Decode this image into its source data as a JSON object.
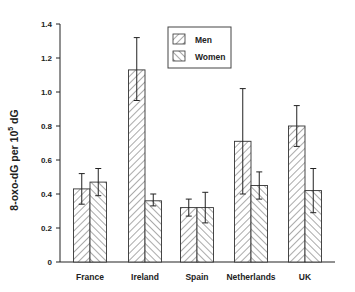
{
  "chart_data": {
    "type": "bar",
    "title": "",
    "xlabel": "",
    "ylabel": "8-oxo-dG per 10^5 dG",
    "ylabel_main": "8-oxo-dG per 10",
    "ylabel_sup": "5",
    "ylabel_tail": " dG",
    "ylim": [
      0,
      1.4
    ],
    "yticks": [
      0,
      0.2,
      0.4,
      0.6,
      0.8,
      1.0,
      1.2,
      1.4
    ],
    "ytick_labels": [
      "0",
      "0.2",
      "0.4",
      "0.6",
      "0.8",
      "1.0",
      "1.2",
      "1.4"
    ],
    "categories": [
      "France",
      "Ireland",
      "Spain",
      "Netherlands",
      "UK"
    ],
    "series": [
      {
        "name": "Men",
        "pattern": "forward-hatch",
        "values": [
          0.43,
          1.13,
          0.32,
          0.71,
          0.8
        ],
        "error_low": [
          0.34,
          0.95,
          0.27,
          0.4,
          0.68
        ],
        "error_high": [
          0.52,
          1.32,
          0.37,
          1.02,
          0.92
        ]
      },
      {
        "name": "Women",
        "pattern": "back-hatch",
        "values": [
          0.47,
          0.36,
          0.32,
          0.45,
          0.42
        ],
        "error_low": [
          0.39,
          0.33,
          0.23,
          0.37,
          0.29
        ],
        "error_high": [
          0.55,
          0.4,
          0.41,
          0.53,
          0.55
        ]
      }
    ],
    "legend": {
      "position": "upper-center",
      "entries": [
        "Men",
        "Women"
      ]
    },
    "grid": false,
    "colors": {
      "bar_stroke": "#333333",
      "hatch": "#555555",
      "axis": "#222222",
      "background": "#ffffff"
    }
  }
}
